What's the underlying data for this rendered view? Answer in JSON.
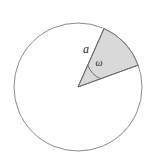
{
  "figure": {
    "type": "geometry-diagram",
    "background_color": "#ffffff",
    "circle": {
      "name": "circle-outline",
      "center_x": 78,
      "center_y": 87,
      "radius": 64,
      "stroke_color": "#8a8a8a",
      "stroke_width": 1,
      "fill": "none"
    },
    "sector": {
      "name": "shaded-sector",
      "center_x": 78,
      "center_y": 87,
      "radius": 64,
      "start_angle_deg": 20,
      "end_angle_deg": 66,
      "fill_color": "#d9d9d9",
      "stroke_color": "#6e6e6e",
      "stroke_width": 1
    },
    "angle_arc": {
      "name": "angle-arc-omega",
      "radius": 24,
      "stroke_color": "#6e6e6e",
      "stroke_width": 1
    },
    "labels": {
      "radius_label": "a",
      "angle_label": "ω"
    },
    "label_positions": {
      "radius_label_x": 86,
      "radius_label_y": 53,
      "angle_label_x": 99,
      "angle_label_y": 66
    }
  }
}
